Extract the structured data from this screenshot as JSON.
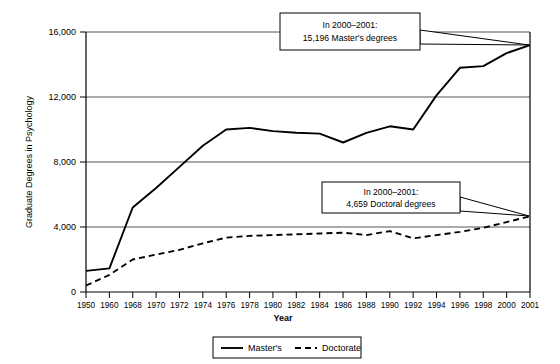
{
  "chart_data": {
    "type": "line",
    "title": "",
    "xlabel": "Year",
    "ylabel": "Graduate Degrees in Psychology",
    "ylim": [
      0,
      16000
    ],
    "yticks": [
      "0",
      "4,000",
      "8,000",
      "12,000",
      "16,000"
    ],
    "ytick_values": [
      0,
      4000,
      8000,
      12000,
      16000
    ],
    "grid": "horizontal",
    "legend_position": "bottom-center",
    "categories": [
      "1950",
      "1960",
      "1968",
      "1970",
      "1972",
      "1974",
      "1976",
      "1978",
      "1980",
      "1982",
      "1984",
      "1986",
      "1988",
      "1990",
      "1992",
      "1994",
      "1996",
      "1998",
      "2000",
      "2001"
    ],
    "series": [
      {
        "name": "Master's",
        "style": "solid",
        "values": [
          1300,
          1450,
          5200,
          6400,
          7700,
          9000,
          10000,
          10100,
          9900,
          9800,
          9750,
          9200,
          9800,
          10200,
          10000,
          12100,
          13800,
          13900,
          14700,
          15196
        ]
      },
      {
        "name": "Doctorate",
        "style": "dashed",
        "values": [
          400,
          1050,
          2000,
          2300,
          2600,
          3000,
          3350,
          3450,
          3500,
          3550,
          3600,
          3650,
          3500,
          3750,
          3300,
          3500,
          3700,
          3950,
          4300,
          4659
        ]
      }
    ],
    "annotations": [
      {
        "id": "masters-callout",
        "line1": "In 2000–2001:",
        "line2": "15,196 Master's degrees",
        "points_to_series": "Master's",
        "points_to_category": "2001"
      },
      {
        "id": "doctorate-callout",
        "line1": "In 2000–2001:",
        "line2": "4,659 Doctoral degrees",
        "points_to_series": "Doctorate",
        "points_to_category": "2001"
      }
    ],
    "legend": [
      {
        "label": "Master's",
        "style": "solid"
      },
      {
        "label": "Doctorate",
        "style": "dashed"
      }
    ]
  }
}
